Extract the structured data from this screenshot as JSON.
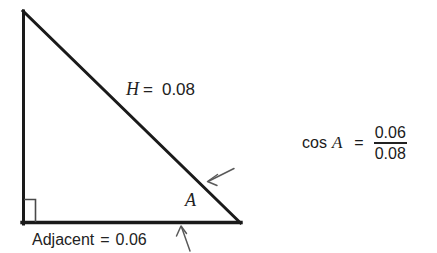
{
  "figure": {
    "type": "right-triangle-trigonometry-diagram",
    "background_color": "#ffffff",
    "stroke_color": "#1a1a1a",
    "arrow_color": "#555555",
    "right_angle_marker_color": "#4a4a4a",
    "triangle": {
      "apex_label": "",
      "vertices": {
        "top_left": [
          22,
          10
        ],
        "bottom_left": [
          22,
          224
        ],
        "bottom_right": [
          240,
          224
        ]
      }
    },
    "labels": {
      "hypotenuse_var": "H",
      "hypotenuse_equals": "=",
      "hypotenuse_value": "0.08",
      "angle_label": "A",
      "adjacent_name": "Adjacent",
      "adjacent_equals": "=",
      "adjacent_value": "0.06"
    },
    "annotations": {
      "hypotenuse_arrow": "arrow-pointing-to-hypotenuse",
      "adjacent_arrow": "arrow-pointing-to-adjacent-side",
      "right_angle_marker": "right-angle-square"
    }
  },
  "equation": {
    "function_name": "cos",
    "angle_variable": "A",
    "equals_sign": "=",
    "numerator": "0.06",
    "denominator": "0.08"
  }
}
